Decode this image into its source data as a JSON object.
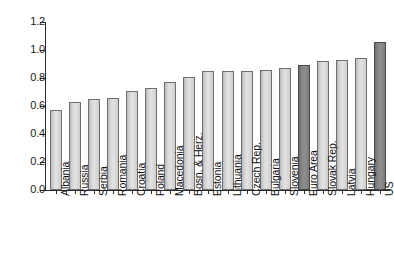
{
  "chart_data": {
    "type": "bar",
    "title": "",
    "subtitle": "",
    "xlabel": "",
    "ylabel": "",
    "ylim": [
      0.0,
      1.2
    ],
    "ytick_labels": [
      "1.2",
      "1.0",
      "0.8",
      "0.6",
      "0.4",
      "0.2",
      "0.0"
    ],
    "yticks": [
      1.2,
      1.0,
      0.8,
      0.6,
      0.4,
      0.2,
      0.0
    ],
    "grid": false,
    "legend": "none",
    "categories": [
      "Albania",
      "Russia",
      "Serbia",
      "Romania",
      "Croatia",
      "Poland",
      "Macedonia",
      "Bosn. & Herz.",
      "Estonia",
      "Lithuania",
      "Czech Rep.",
      "Bulgaria",
      "Slovenia",
      "Euro Area",
      "Slovak Rep.",
      "Latvia",
      "Hungary",
      "US"
    ],
    "values": [
      0.57,
      0.63,
      0.65,
      0.66,
      0.71,
      0.73,
      0.77,
      0.81,
      0.85,
      0.85,
      0.85,
      0.86,
      0.87,
      0.89,
      0.92,
      0.93,
      0.94,
      1.06
    ],
    "highlighted": [
      "Euro Area",
      "US"
    ],
    "colors": {
      "bar_light": "#d8d8d8",
      "bar_light_edge": "#707070",
      "bar_dark": "#878787",
      "bar_dark_edge": "#4a4a4a",
      "axis": "#2b2b2b",
      "text": "#101010",
      "background": "#ffffff"
    }
  }
}
